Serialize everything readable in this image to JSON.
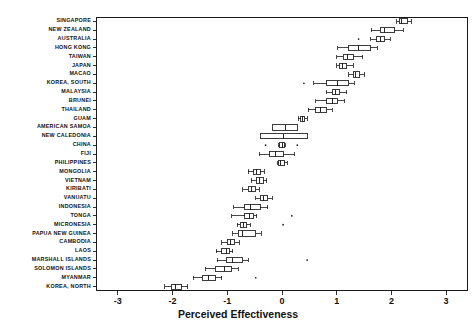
{
  "chart_data": {
    "type": "box",
    "title": "",
    "xlabel": "Perceived Effectiveness",
    "ylabel": "",
    "xlim": [
      -3.4,
      3.4
    ],
    "xticks": [
      -3,
      -2,
      -1,
      0,
      1,
      2,
      3
    ],
    "xticklabels": [
      "-3",
      "-2",
      "-1",
      "0",
      "1",
      "2",
      "3"
    ],
    "grid": false,
    "orientation": "horizontal",
    "categories": [
      "SINGAPORE",
      "NEW ZEALAND",
      "AUSTRALIA",
      "HONG KONG",
      "TAIWAN",
      "JAPAN",
      "MACAO",
      "KOREA, SOUTH",
      "MALAYSIA",
      "BRUNEI",
      "THAILAND",
      "GUAM",
      "AMERICAN SAMOA",
      "NEW CALEDONIA",
      "CHINA",
      "FIJI",
      "PHILIPPINES",
      "MONGOLIA",
      "VIETNAM",
      "KIRIBATI",
      "VANUATU",
      "INDONESIA",
      "TONGA",
      "MICRONESIA",
      "PAPUA NEW GUINEA",
      "CAMBODIA",
      "LAOS",
      "MARSHALL ISLANDS",
      "SOLOMON ISLANDS",
      "MYANMAR",
      "KOREA, NORTH"
    ],
    "boxes": [
      {
        "category": "SINGAPORE",
        "whisker_low": 2.1,
        "q1": 2.14,
        "median": 2.19,
        "q3": 2.3,
        "whisker_high": 2.36,
        "outliers": []
      },
      {
        "category": "NEW ZEALAND",
        "whisker_low": 1.63,
        "q1": 1.8,
        "median": 1.88,
        "q3": 2.05,
        "whisker_high": 2.22,
        "outliers": []
      },
      {
        "category": "AUSTRALIA",
        "whisker_low": 1.62,
        "q1": 1.73,
        "median": 1.8,
        "q3": 1.88,
        "whisker_high": 1.98,
        "outliers": [
          1.4
        ]
      },
      {
        "category": "HONG KONG",
        "whisker_low": 1.02,
        "q1": 1.22,
        "median": 1.4,
        "q3": 1.62,
        "whisker_high": 1.74,
        "outliers": []
      },
      {
        "category": "TAIWAN",
        "whisker_low": 1.0,
        "q1": 1.12,
        "median": 1.2,
        "q3": 1.3,
        "whisker_high": 1.48,
        "outliers": []
      },
      {
        "category": "JAPAN",
        "whisker_low": 1.0,
        "q1": 1.05,
        "median": 1.1,
        "q3": 1.18,
        "whisker_high": 1.3,
        "outliers": []
      },
      {
        "category": "MACAO",
        "whisker_low": 1.22,
        "q1": 1.3,
        "median": 1.35,
        "q3": 1.42,
        "whisker_high": 1.5,
        "outliers": []
      },
      {
        "category": "KOREA, SOUTH",
        "whisker_low": 0.58,
        "q1": 0.82,
        "median": 1.02,
        "q3": 1.22,
        "whisker_high": 1.32,
        "outliers": [
          0.4
        ]
      },
      {
        "category": "MALAYSIA",
        "whisker_low": 0.82,
        "q1": 0.92,
        "median": 0.98,
        "q3": 1.06,
        "whisker_high": 1.18,
        "outliers": []
      },
      {
        "category": "BRUNEI",
        "whisker_low": 0.62,
        "q1": 0.82,
        "median": 0.92,
        "q3": 1.02,
        "whisker_high": 1.14,
        "outliers": []
      },
      {
        "category": "THAILAND",
        "whisker_low": 0.48,
        "q1": 0.62,
        "median": 0.7,
        "q3": 0.82,
        "whisker_high": 0.92,
        "outliers": []
      },
      {
        "category": "GUAM",
        "whisker_low": 0.3,
        "q1": 0.34,
        "median": 0.38,
        "q3": 0.42,
        "whisker_high": 0.46,
        "outliers": []
      },
      {
        "category": "AMERICAN SAMOA",
        "whisker_low": -0.18,
        "q1": -0.18,
        "median": 0.06,
        "q3": 0.28,
        "whisker_high": 0.28,
        "outliers": []
      },
      {
        "category": "NEW CALEDONIA",
        "whisker_low": -0.4,
        "q1": -0.4,
        "median": 0.02,
        "q3": 0.46,
        "whisker_high": 0.46,
        "outliers": []
      },
      {
        "category": "CHINA",
        "whisker_low": -0.06,
        "q1": -0.04,
        "median": 0.0,
        "q3": 0.04,
        "whisker_high": 0.06,
        "outliers": [
          -0.3,
          0.28
        ]
      },
      {
        "category": "FIJI",
        "whisker_low": -0.42,
        "q1": -0.22,
        "median": -0.12,
        "q3": 0.02,
        "whisker_high": 0.22,
        "outliers": []
      },
      {
        "category": "PHILIPPINES",
        "whisker_low": -0.08,
        "q1": -0.06,
        "median": -0.02,
        "q3": 0.04,
        "whisker_high": 0.1,
        "outliers": []
      },
      {
        "category": "MONGOLIA",
        "whisker_low": -0.62,
        "q1": -0.52,
        "median": -0.46,
        "q3": -0.4,
        "whisker_high": -0.32,
        "outliers": []
      },
      {
        "category": "VIETNAM",
        "whisker_low": -0.56,
        "q1": -0.46,
        "median": -0.42,
        "q3": -0.34,
        "whisker_high": -0.28,
        "outliers": []
      },
      {
        "category": "KIRIBATI",
        "whisker_low": -0.72,
        "q1": -0.62,
        "median": -0.56,
        "q3": -0.48,
        "whisker_high": -0.42,
        "outliers": []
      },
      {
        "category": "VANUATU",
        "whisker_low": -0.48,
        "q1": -0.4,
        "median": -0.34,
        "q3": -0.26,
        "whisker_high": -0.18,
        "outliers": []
      },
      {
        "category": "INDONESIA",
        "whisker_low": -0.88,
        "q1": -0.68,
        "median": -0.58,
        "q3": -0.4,
        "whisker_high": -0.26,
        "outliers": []
      },
      {
        "category": "TONGA",
        "whisker_low": -0.92,
        "q1": -0.68,
        "median": -0.6,
        "q3": -0.52,
        "whisker_high": -0.46,
        "outliers": [
          0.18
        ]
      },
      {
        "category": "MICRONESIA",
        "whisker_low": -0.82,
        "q1": -0.76,
        "median": -0.7,
        "q3": -0.64,
        "whisker_high": -0.58,
        "outliers": [
          0.02
        ]
      },
      {
        "category": "PAPUA NEW GUINEA",
        "whisker_low": -0.9,
        "q1": -0.8,
        "median": -0.72,
        "q3": -0.48,
        "whisker_high": -0.38,
        "outliers": []
      },
      {
        "category": "CAMBODIA",
        "whisker_low": -1.1,
        "q1": -1.0,
        "median": -0.94,
        "q3": -0.86,
        "whisker_high": -0.78,
        "outliers": []
      },
      {
        "category": "LAOS",
        "whisker_low": -1.2,
        "q1": -1.1,
        "median": -1.02,
        "q3": -0.96,
        "whisker_high": -0.9,
        "outliers": []
      },
      {
        "category": "MARSHALL ISLANDS",
        "whisker_low": -1.18,
        "q1": -1.02,
        "median": -0.9,
        "q3": -0.72,
        "whisker_high": -0.62,
        "outliers": [
          0.46
        ]
      },
      {
        "category": "SOLOMON ISLANDS",
        "whisker_low": -1.4,
        "q1": -1.22,
        "median": -1.06,
        "q3": -0.92,
        "whisker_high": -0.8,
        "outliers": []
      },
      {
        "category": "MYANMAR",
        "whisker_low": -1.62,
        "q1": -1.46,
        "median": -1.34,
        "q3": -1.22,
        "whisker_high": -1.1,
        "outliers": [
          -0.48
        ]
      },
      {
        "category": "KOREA, NORTH",
        "whisker_low": -2.14,
        "q1": -2.02,
        "median": -1.94,
        "q3": -1.84,
        "whisker_high": -1.72,
        "outliers": []
      }
    ],
    "colors": {
      "line": "#1a1a1a",
      "box_fill": "#ffffff",
      "frame": "#1a1a1a",
      "text": "#111111"
    }
  }
}
